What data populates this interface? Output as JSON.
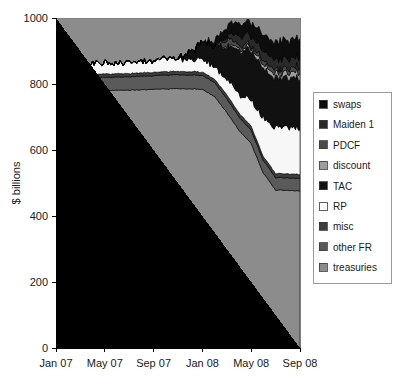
{
  "chart_data": {
    "type": "area",
    "stacked": true,
    "title": "",
    "subtitle": "",
    "xlabel": "",
    "ylabel": "$ billions",
    "ylim": [
      0,
      1000
    ],
    "yticks": [
      0,
      200,
      400,
      600,
      800,
      1000
    ],
    "xticks": [
      "Jan 07",
      "May 07",
      "Sep 07",
      "Jan 08",
      "May 08",
      "Sep 08"
    ],
    "xlim_labels": [
      "Jan 07",
      "Sep 08"
    ],
    "grid": false,
    "legend_position": "right",
    "x": [
      "Jan 07",
      "Feb 07",
      "Mar 07",
      "Apr 07",
      "May 07",
      "Jun 07",
      "Jul 07",
      "Aug 07",
      "Sep 07",
      "Oct 07",
      "Nov 07",
      "Dec 07",
      "Jan 08",
      "Feb 08",
      "Mar 08",
      "Apr 08",
      "May 08",
      "Jun 08",
      "Jul 08",
      "Aug 08",
      "Sep 08"
    ],
    "series": [
      {
        "name": "treasuries",
        "color": "#8c8c8c",
        "values": [
          780,
          780,
          779,
          779,
          780,
          781,
          782,
          783,
          784,
          785,
          786,
          786,
          784,
          762,
          714,
          660,
          620,
          530,
          479,
          478,
          476
        ]
      },
      {
        "name": "other FR",
        "color": "#5a5a5a",
        "values": [
          40,
          40,
          40,
          40,
          40,
          40,
          40,
          41,
          41,
          42,
          42,
          42,
          42,
          42,
          42,
          40,
          40,
          38,
          38,
          38,
          38
        ]
      },
      {
        "name": "misc",
        "color": "#3d3d3d",
        "values": [
          10,
          10,
          10,
          10,
          10,
          10,
          10,
          10,
          10,
          10,
          10,
          10,
          10,
          10,
          12,
          12,
          12,
          12,
          12,
          12,
          12
        ]
      },
      {
        "name": "RP",
        "color": "#f7f7f7",
        "values": [
          32,
          33,
          32,
          33,
          34,
          33,
          34,
          35,
          36,
          35,
          36,
          36,
          36,
          40,
          48,
          56,
          80,
          120,
          138,
          140,
          142
        ]
      },
      {
        "name": "TAC",
        "color": "#111111",
        "values": [
          0,
          0,
          0,
          0,
          0,
          0,
          0,
          0,
          0,
          0,
          0,
          20,
          50,
          60,
          100,
          130,
          150,
          150,
          150,
          150,
          150
        ]
      },
      {
        "name": "discount",
        "color": "#9e9e9e",
        "values": [
          0,
          0,
          0,
          0,
          0,
          0,
          0,
          1,
          1,
          1,
          1,
          1,
          1,
          1,
          4,
          6,
          10,
          12,
          14,
          16,
          18
        ]
      },
      {
        "name": "PDCF",
        "color": "#4a4a4a",
        "values": [
          0,
          0,
          0,
          0,
          0,
          0,
          0,
          0,
          0,
          0,
          0,
          0,
          0,
          0,
          18,
          12,
          8,
          10,
          12,
          12,
          14
        ]
      },
      {
        "name": "Maiden 1",
        "color": "#2a2a2a",
        "values": [
          0,
          0,
          0,
          0,
          0,
          0,
          0,
          0,
          0,
          0,
          0,
          0,
          0,
          0,
          10,
          28,
          29,
          29,
          29,
          29,
          29
        ]
      },
      {
        "name": "swaps",
        "color": "#0d0d0d",
        "values": [
          0,
          0,
          0,
          0,
          0,
          0,
          0,
          0,
          0,
          0,
          0,
          0,
          0,
          14,
          28,
          36,
          42,
          50,
          54,
          56,
          58
        ]
      }
    ]
  },
  "legend": {
    "items": [
      {
        "label": "swaps",
        "color": "#0d0d0d"
      },
      {
        "label": "Maiden 1",
        "color": "#2a2a2a"
      },
      {
        "label": "PDCF",
        "color": "#4a4a4a"
      },
      {
        "label": "discount",
        "color": "#9e9e9e"
      },
      {
        "label": "TAC",
        "color": "#111111"
      },
      {
        "label": "RP",
        "color": "#fbfbfb"
      },
      {
        "label": "misc",
        "color": "#3d3d3d"
      },
      {
        "label": "other FR",
        "color": "#5a5a5a"
      },
      {
        "label": "treasuries",
        "color": "#8c8c8c"
      }
    ]
  },
  "axes": {
    "y_title": "$ billions",
    "y_tick_labels": [
      "1000",
      "800",
      "600",
      "400",
      "200",
      "0"
    ],
    "x_tick_labels": [
      "Jan 07",
      "May 07",
      "Sep 07",
      "Jan 08",
      "May 08",
      "Sep 08"
    ]
  },
  "colors": {
    "plot_background": "#8c8c8c",
    "page_background": "#ffffff",
    "axis": "#000000",
    "legend_border": "#9a9a9a"
  }
}
